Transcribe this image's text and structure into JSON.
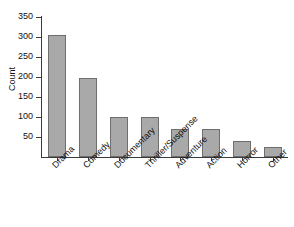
{
  "chart_data": {
    "type": "bar",
    "title": "",
    "xlabel": "",
    "ylabel": "Count",
    "categories": [
      "Drama",
      "Comedy",
      "Documentary",
      "Thriller/Suspense",
      "Adventure",
      "Action",
      "Horror",
      "Other"
    ],
    "values": [
      305,
      197,
      100,
      100,
      70,
      70,
      40,
      25
    ],
    "ylim": [
      0,
      350
    ],
    "yticks": [
      0,
      50,
      100,
      150,
      200,
      250,
      300,
      350
    ],
    "ytick_labels": [
      "",
      "50",
      "100",
      "150",
      "200",
      "250",
      "300",
      "350"
    ],
    "grid": false,
    "legend": null,
    "bar_fill_color": "#a9a9a9",
    "bar_edge_color": "#6e6e6e",
    "axis_color": "#3b3b3b",
    "background_color": "#ffffff"
  }
}
